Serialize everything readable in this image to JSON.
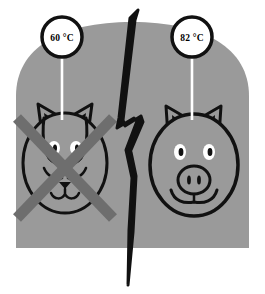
{
  "illustration": {
    "title": "Cooking temperature comparison: cat not allowed, pig allowed",
    "background_color": "#ffffff",
    "panel_color": "#9a9a9a",
    "outline_color": "#111111",
    "cross_color": "#6e6e6e",
    "callout_fill": "#ffffff",
    "callout_stroke": "#111111",
    "stem_color": "#ffffff",
    "bolt_color": "#111111"
  },
  "callouts": [
    {
      "id": "left-callout",
      "name": "temperature-callout-left",
      "value": "60 °C",
      "cx": 62,
      "cy": 37,
      "r": 21,
      "stem_x": 62,
      "stem_y1": 58,
      "stem_y2": 118
    },
    {
      "id": "right-callout",
      "name": "temperature-callout-right",
      "value": "82 °C",
      "cx": 192,
      "cy": 37,
      "r": 21,
      "stem_x": 192,
      "stem_y1": 58,
      "stem_y2": 118
    }
  ],
  "subjects": [
    {
      "id": "cat",
      "name": "cat-face",
      "label": "cat",
      "crossed_out": true,
      "temperature": "60 °C"
    },
    {
      "id": "pig",
      "name": "pig-face",
      "label": "pig",
      "crossed_out": false,
      "temperature": "82 °C"
    }
  ],
  "divider": {
    "name": "lightning-bolt-divider",
    "label": "lightning bolt crack"
  }
}
